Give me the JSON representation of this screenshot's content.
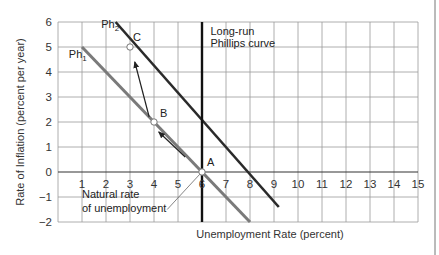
{
  "chart_data": {
    "type": "line",
    "title": "",
    "xlabel": "Unemployment Rate (percent)",
    "ylabel": "Rate of Inflation (percent per year)",
    "xlim": [
      0,
      15
    ],
    "ylim": [
      -2,
      6
    ],
    "grid": true,
    "x_ticks": [
      "1",
      "2",
      "3",
      "4",
      "5",
      "6",
      "7",
      "8",
      "9",
      "10",
      "11",
      "12",
      "13",
      "14",
      "15"
    ],
    "y_ticks": [
      "6",
      "5",
      "4",
      "3",
      "2",
      "1",
      "0",
      "−1",
      "−2"
    ],
    "y_tick_values": [
      6,
      5,
      4,
      3,
      2,
      1,
      0,
      -1,
      -2
    ],
    "x_tick_values": [
      1,
      2,
      3,
      4,
      5,
      6,
      7,
      8,
      9,
      10,
      11,
      12,
      13,
      14,
      15
    ],
    "series": [
      {
        "name": "Ph1",
        "label_main": "Ph",
        "label_sub": "1",
        "x": [
          1,
          8
        ],
        "y": [
          5,
          -2
        ],
        "color": "#7a7a7a"
      },
      {
        "name": "Ph2",
        "label_main": "Ph",
        "label_sub": "2",
        "x": [
          2.4,
          9.2
        ],
        "y": [
          6,
          -1.4
        ],
        "color": "#2a2a2a"
      },
      {
        "name": "Long-run Phillips curve",
        "label_lines": [
          "Long-run",
          "Phillips curve"
        ],
        "x": [
          6,
          6
        ],
        "y": [
          6,
          -2
        ],
        "color": "#111111"
      }
    ],
    "points": [
      {
        "label": "A",
        "x": 6,
        "y": 0
      },
      {
        "label": "B",
        "x": 4,
        "y": 2
      },
      {
        "label": "C",
        "x": 3,
        "y": 5
      }
    ],
    "arrows": [
      {
        "from": [
          5.3,
          0.6
        ],
        "to": [
          4.2,
          1.6
        ]
      },
      {
        "from": [
          3.8,
          2.2
        ],
        "to": [
          3.2,
          4.4
        ]
      }
    ],
    "annotations": [
      {
        "text_lines": [
          "Natural rate",
          "of unemployment"
        ],
        "points_to": [
          6,
          0
        ]
      }
    ]
  }
}
